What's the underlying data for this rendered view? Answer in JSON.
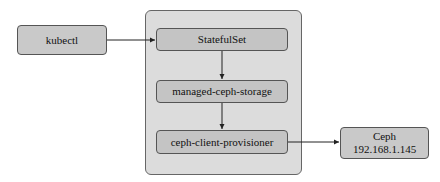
{
  "nodes": {
    "kubectl": {
      "label": "kubectl"
    },
    "statefulset": {
      "label": "StatefulSet"
    },
    "managed_ceph_storage": {
      "label": "managed-ceph-storage"
    },
    "ceph_client_provisioner": {
      "label": "ceph-client-provisioner"
    },
    "ceph": {
      "label": "Ceph",
      "ip": "192.168.1.145"
    }
  },
  "edges": [
    {
      "from": "kubectl",
      "to": "StatefulSet"
    },
    {
      "from": "StatefulSet",
      "to": "managed-ceph-storage"
    },
    {
      "from": "managed-ceph-storage",
      "to": "ceph-client-provisioner"
    },
    {
      "from": "ceph-client-provisioner",
      "to": "Ceph"
    }
  ],
  "colors": {
    "node_fill": "#c9c9c9",
    "container_fill": "#dcdcdc",
    "border": "#555555"
  }
}
